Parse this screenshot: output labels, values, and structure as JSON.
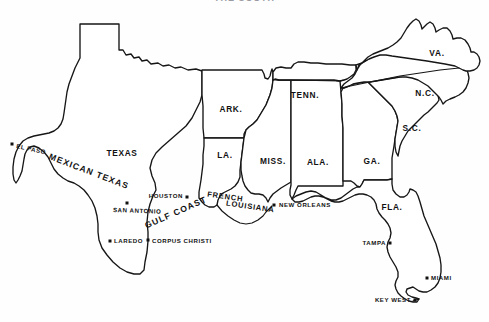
{
  "page": {
    "title_clipped": "THE SOUTH",
    "background_color": "#fefefe",
    "ink_color": "#161616"
  },
  "map": {
    "name": "southern-united-states-map",
    "states": [
      {
        "id": "texas",
        "label": "TEXAS",
        "label_x": 122,
        "label_y": 156
      },
      {
        "id": "arkansas",
        "label": "ARK.",
        "label_x": 231,
        "label_y": 112
      },
      {
        "id": "louisiana",
        "label": "LA.",
        "label_x": 225,
        "label_y": 158
      },
      {
        "id": "mississippi",
        "label": "MISS.",
        "label_x": 273,
        "label_y": 164
      },
      {
        "id": "alabama",
        "label": "ALA.",
        "label_x": 318,
        "label_y": 165
      },
      {
        "id": "georgia",
        "label": "GA.",
        "label_x": 372,
        "label_y": 164
      },
      {
        "id": "tennessee",
        "label": "TENN.",
        "label_x": 305,
        "label_y": 98
      },
      {
        "id": "virginia",
        "label": "VA.",
        "label_x": 437,
        "label_y": 56
      },
      {
        "id": "north-carolina",
        "label": "N.C.",
        "label_x": 425,
        "label_y": 96
      },
      {
        "id": "south-carolina",
        "label": "S.C.",
        "label_x": 412,
        "label_y": 131
      },
      {
        "id": "florida",
        "label": "FLA.",
        "label_x": 392,
        "label_y": 210
      }
    ],
    "regions": [
      {
        "id": "mexican-texas",
        "label": "MEXICAN TEXAS",
        "x": 88,
        "y": 174,
        "rotation": 21,
        "size": "normal"
      },
      {
        "id": "gulf-coast",
        "label": "GULF COAST",
        "x": 177,
        "y": 215,
        "rotation": -24,
        "size": "normal"
      },
      {
        "id": "french-louisiana-line1",
        "label": "FRENCH",
        "x": 225,
        "y": 199,
        "rotation": 8,
        "size": "small"
      },
      {
        "id": "french-louisiana-line2",
        "label": "LOUISIANA",
        "x": 250,
        "y": 209,
        "rotation": 8,
        "size": "small"
      }
    ],
    "cities": [
      {
        "id": "el-paso",
        "label": "EL PASO",
        "dot_x": 12,
        "dot_y": 144,
        "text_x": 20,
        "text_y": 149,
        "anchor": "start",
        "rotation": 12
      },
      {
        "id": "houston",
        "label": "HOUSTON",
        "dot_x": 187,
        "dot_y": 197,
        "text_x": 183,
        "text_y": 199,
        "anchor": "end",
        "rotation": 0
      },
      {
        "id": "san-antonio",
        "label": "SAN ANTONIO",
        "dot_x": 127,
        "dot_y": 203,
        "text_x": 116,
        "text_y": 212,
        "anchor": "start",
        "rotation": 2
      },
      {
        "id": "laredo",
        "label": "LAREDO",
        "dot_x": 110,
        "dot_y": 241,
        "text_x": 115,
        "text_y": 243,
        "anchor": "start",
        "rotation": 0
      },
      {
        "id": "corpus-christi",
        "label": "CORPUS CHRISTI",
        "dot_x": 148,
        "dot_y": 240,
        "text_x": 153,
        "text_y": 243,
        "anchor": "start",
        "rotation": 0
      },
      {
        "id": "new-orleans",
        "label": "NEW ORLEANS",
        "dot_x": 274,
        "dot_y": 205,
        "text_x": 280,
        "text_y": 208,
        "anchor": "start",
        "rotation": 0
      },
      {
        "id": "tampa",
        "label": "TAMPA",
        "dot_x": 390,
        "dot_y": 243,
        "text_x": 386,
        "text_y": 245,
        "anchor": "end",
        "rotation": 0
      },
      {
        "id": "miami",
        "label": "MIAMI",
        "dot_x": 427,
        "dot_y": 278,
        "text_x": 432,
        "text_y": 281,
        "anchor": "start",
        "rotation": 0
      },
      {
        "id": "key-west",
        "label": "KEY WEST",
        "dot_x": 415,
        "dot_y": 300,
        "text_x": 411,
        "text_y": 302,
        "anchor": "end",
        "rotation": 0
      }
    ]
  }
}
